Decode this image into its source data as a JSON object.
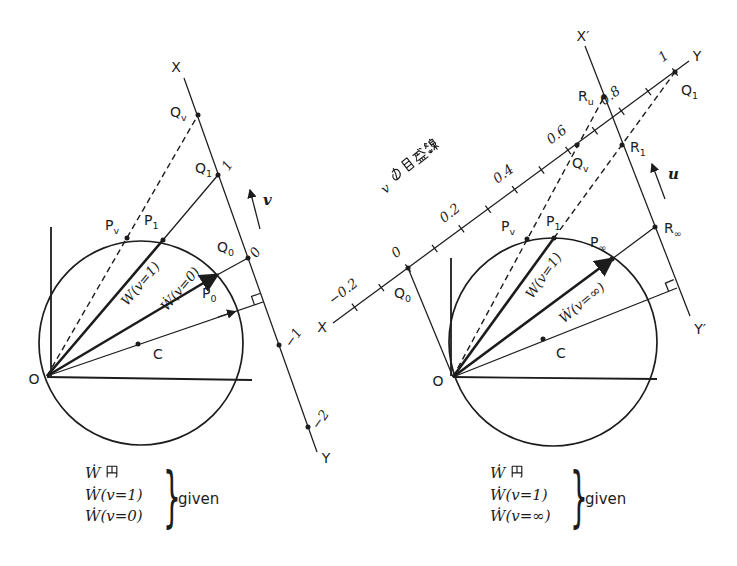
{
  "colors": {
    "background": "#ffffff",
    "ink": "#1c1c1c"
  },
  "left": {
    "line_x_label": "X",
    "line_y_label": "Y",
    "origin_label": "O",
    "center_label": "C",
    "points": {
      "Qv": {
        "base": "Q",
        "sub": "v"
      },
      "Q1": {
        "base": "Q",
        "sub": "1"
      },
      "Q0": {
        "base": "Q",
        "sub": "0"
      },
      "Pv": {
        "base": "P",
        "sub": "v"
      },
      "P1": {
        "base": "P",
        "sub": "1"
      },
      "P0": {
        "base": "P",
        "sub": "0"
      }
    },
    "ticks": {
      "t1": "1",
      "t0": "0",
      "tm1": "−1",
      "tm2": "−2"
    },
    "v_arrow_label": "v",
    "phasor_labels": {
      "v1": "W(v=1)",
      "v0": "Ẇ(v=0)"
    },
    "legend": {
      "line1_w": "Ẇ",
      "line1_kanji": "円",
      "line2": "Ẇ(v=1)",
      "line3": "Ẇ(v=0)",
      "brace": "}",
      "note": "given"
    }
  },
  "right": {
    "line_x_label": "X′",
    "line_y_label": "Y′",
    "scale_x_label": "X",
    "scale_y_label": "Y",
    "origin_label": "O",
    "center_label": "C",
    "points": {
      "Q0": {
        "base": "Q",
        "sub": "0"
      },
      "Qv": {
        "base": "Q",
        "sub": "v"
      },
      "Q1": {
        "base": "Q",
        "sub": "1"
      },
      "Pv": {
        "base": "P",
        "sub": "v"
      },
      "P1": {
        "base": "P",
        "sub": "1"
      },
      "Pinf": {
        "base": "P",
        "sub": "∞"
      },
      "Ru": {
        "base": "R",
        "sub": "u"
      },
      "R1": {
        "base": "R",
        "sub": "1"
      },
      "Rinf": {
        "base": "R",
        "sub": "∞"
      }
    },
    "scale": {
      "m02": "−0.2",
      "z": "0",
      "p02": "0.2",
      "p04": "0.4",
      "p06": "0.6",
      "p08": "0.8",
      "p1": "1"
    },
    "scale_title": {
      "prefix": "v",
      "kanji": "の目盛線",
      "full": "vの目盛線"
    },
    "u_arrow_label": "u",
    "phasor_labels": {
      "v1": "W(v=1)",
      "vinf": "Ẇ(v=∞)"
    },
    "legend": {
      "line1_w": "Ẇ",
      "line1_kanji": "円",
      "line2": "Ẇ(v=1)",
      "line3": "Ẇ(v=∞)",
      "brace": "}",
      "note": "given"
    }
  }
}
